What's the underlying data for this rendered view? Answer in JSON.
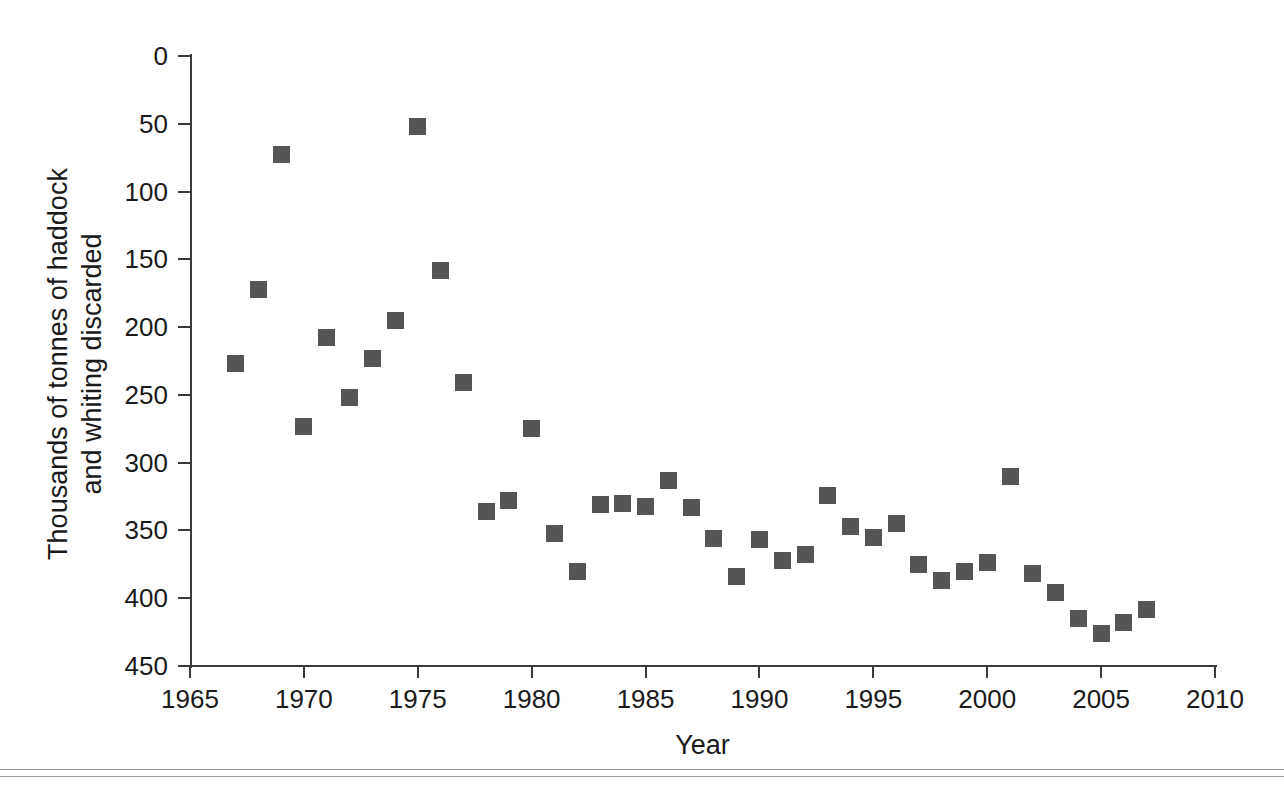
{
  "figure": {
    "background": "#ffffff",
    "marker_color": "#555555",
    "axis_color": "#3a3a3a",
    "rule_color": "#9a9a9a"
  },
  "axes": {
    "y_title": "Thousands of tonnes of haddock and whiting discarded",
    "y_title_line1": "Thousands of tonnes of haddock",
    "y_title_line2": "and whiting discarded",
    "x_title": "Year",
    "y_ticks": [
      "450",
      "400",
      "350",
      "300",
      "250",
      "200",
      "150",
      "100",
      "50",
      "0"
    ],
    "x_ticks": [
      "1965",
      "1970",
      "1975",
      "1980",
      "1985",
      "1990",
      "1995",
      "2000",
      "2005",
      "2010"
    ]
  },
  "chart_data": {
    "type": "scatter",
    "title": "",
    "xlabel": "Year",
    "ylabel": "Thousands of tonnes of haddock and whiting discarded",
    "xlim": [
      1965,
      2010
    ],
    "ylim": [
      0,
      450
    ],
    "xticks": [
      1965,
      1970,
      1975,
      1980,
      1985,
      1990,
      1995,
      2000,
      2005,
      2010
    ],
    "yticks": [
      0,
      50,
      100,
      150,
      200,
      250,
      300,
      350,
      400,
      450
    ],
    "grid": false,
    "legend": null,
    "marker": "square",
    "series": [
      {
        "name": "Haddock and whiting discards",
        "x": [
          1967,
          1968,
          1969,
          1970,
          1971,
          1972,
          1973,
          1974,
          1975,
          1976,
          1977,
          1978,
          1979,
          1980,
          1981,
          1982,
          1983,
          1984,
          1985,
          1986,
          1987,
          1988,
          1989,
          1990,
          1991,
          1992,
          1993,
          1994,
          1995,
          1996,
          1997,
          1998,
          1999,
          2000,
          2001,
          2002,
          2003,
          2004,
          2005,
          2006,
          2007
        ],
        "y": [
          223,
          278,
          377,
          177,
          242,
          198,
          227,
          255,
          398,
          292,
          209,
          114,
          122,
          175,
          98,
          70,
          119,
          120,
          118,
          137,
          117,
          94,
          66,
          93,
          78,
          82,
          126,
          103,
          95,
          105,
          75,
          63,
          70,
          76,
          140,
          68,
          54,
          35,
          24,
          32,
          42
        ]
      }
    ]
  },
  "caption": {
    "text": ""
  }
}
